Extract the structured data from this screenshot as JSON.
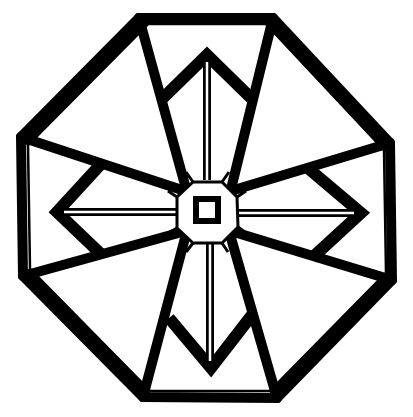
{
  "figure": {
    "width": 413,
    "height": 417,
    "background": "#ffffff",
    "ink": "#000000",
    "thick_stroke": 10,
    "thin_stroke": 2.5,
    "octagon_outer": [
      [
        139,
        18
      ],
      [
        273,
        18
      ],
      [
        390,
        143
      ],
      [
        392,
        280
      ],
      [
        277,
        398
      ],
      [
        143,
        397
      ],
      [
        23,
        276
      ],
      [
        21,
        137
      ]
    ],
    "octagon_inner_rim": [
      [
        148,
        24
      ],
      [
        266,
        24
      ],
      [
        384,
        150
      ],
      [
        386,
        273
      ],
      [
        270,
        391
      ],
      [
        150,
        391
      ],
      [
        30,
        269
      ],
      [
        28,
        145
      ]
    ],
    "spokes": [
      [
        [
          139,
          18
        ],
        [
          185,
          185
        ]
      ],
      [
        [
          273,
          18
        ],
        [
          232,
          185
        ]
      ],
      [
        [
          390,
          143
        ],
        [
          234,
          190
        ]
      ],
      [
        [
          392,
          280
        ],
        [
          234,
          232
        ]
      ],
      [
        [
          277,
          398
        ],
        [
          231,
          238
        ]
      ],
      [
        [
          143,
          397
        ],
        [
          185,
          238
        ]
      ],
      [
        [
          23,
          276
        ],
        [
          182,
          232
        ]
      ],
      [
        [
          21,
          137
        ],
        [
          182,
          190
        ]
      ]
    ],
    "arrows": [
      {
        "name": "top",
        "points": [
          [
            163,
            98
          ],
          [
            207,
            55
          ],
          [
            251,
            98
          ]
        ],
        "shaft": [
          [
            207,
            62
          ],
          [
            207,
            180
          ]
        ]
      },
      {
        "name": "right",
        "points": [
          [
            309,
            169
          ],
          [
            361,
            213
          ],
          [
            312,
            258
          ]
        ],
        "shaft": [
          [
            354,
            213
          ],
          [
            238,
            213
          ]
        ]
      },
      {
        "name": "bottom",
        "points": [
          [
            169,
            318
          ],
          [
            211,
            368
          ],
          [
            252,
            315
          ]
        ],
        "shaft": [
          [
            210,
            361
          ],
          [
            210,
            243
          ]
        ]
      },
      {
        "name": "left",
        "points": [
          [
            101,
            164
          ],
          [
            57,
            212
          ],
          [
            103,
            256
          ]
        ],
        "shaft": [
          [
            64,
            212
          ],
          [
            176,
            212
          ]
        ]
      }
    ],
    "center_octagon": [
      [
        193,
        182
      ],
      [
        222,
        182
      ],
      [
        237,
        197
      ],
      [
        238,
        227
      ],
      [
        222,
        243
      ],
      [
        193,
        243
      ],
      [
        177,
        228
      ],
      [
        177,
        197
      ]
    ],
    "center_square": {
      "x": 196,
      "y": 199,
      "size": 22,
      "stroke": 6
    }
  }
}
